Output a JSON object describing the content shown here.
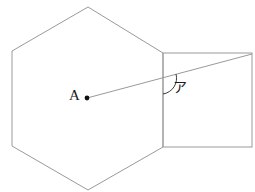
{
  "figure": {
    "background_color": "#ffffff",
    "stroke_color": "#9a9a9a",
    "stroke_width": 1,
    "accent_color": "#1a1a1a",
    "labels": {
      "point_a": "A",
      "angle": "ア"
    },
    "shapes": {
      "hexagon": {
        "name": "hexagon",
        "points": "88,7 163,53 163,147 88,190 12,146 12,51"
      },
      "square": {
        "name": "square",
        "x": 163,
        "y": 53,
        "width": 89,
        "height": 94
      },
      "diagonal_line": {
        "name": "diagonal-line",
        "x1": 87,
        "y1": 98,
        "x2": 252,
        "y2": 54
      },
      "center_point": {
        "name": "center-point-a",
        "cx": 87,
        "cy": 98,
        "r": 2.4
      },
      "angle_arc": {
        "name": "angle-arc",
        "path": "M 163 94 A 16 16 0 0 0 176 74"
      }
    }
  }
}
